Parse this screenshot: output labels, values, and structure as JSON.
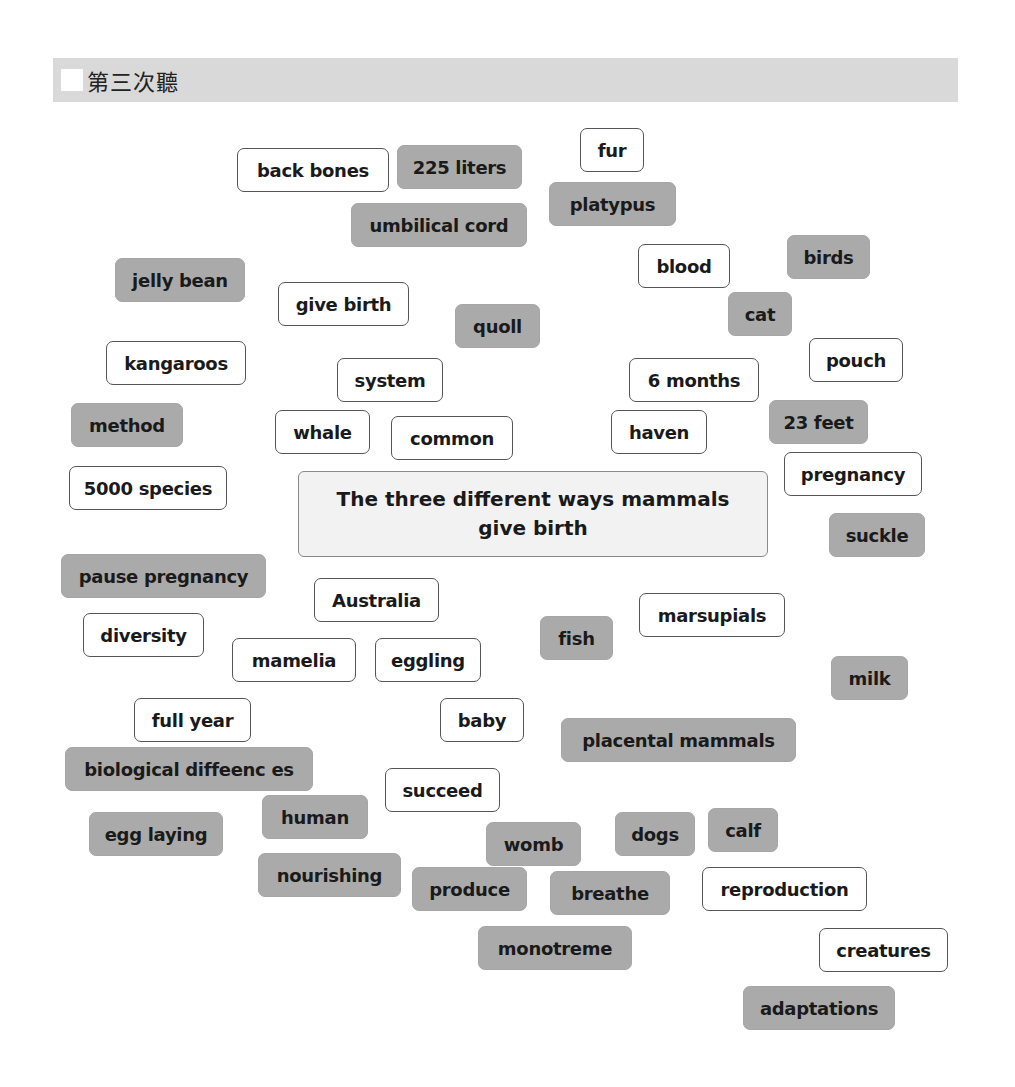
{
  "header": {
    "title": "第三次聽"
  },
  "center": {
    "title": "The three different  ways mammals give birth"
  },
  "colors": {
    "header_band": "#d9d9d9",
    "grey_card": "#aaaaaa",
    "white_card": "#ffffff",
    "center_box": "#f2f2f2",
    "text": "#1a1a1a"
  },
  "cards": [
    {
      "label": "back bones",
      "style": "white",
      "x": 237,
      "y": 148,
      "w": 152
    },
    {
      "label": "225 liters",
      "style": "grey",
      "x": 397,
      "y": 145,
      "w": 125
    },
    {
      "label": "fur",
      "style": "white",
      "x": 580,
      "y": 128,
      "w": 64
    },
    {
      "label": "platypus",
      "style": "grey",
      "x": 549,
      "y": 182,
      "w": 127
    },
    {
      "label": "umbilical cord",
      "style": "grey",
      "x": 351,
      "y": 203,
      "w": 176
    },
    {
      "label": "blood",
      "style": "white",
      "x": 638,
      "y": 244,
      "w": 92
    },
    {
      "label": "birds",
      "style": "grey",
      "x": 787,
      "y": 235,
      "w": 83
    },
    {
      "label": "jelly bean",
      "style": "grey",
      "x": 115,
      "y": 258,
      "w": 130
    },
    {
      "label": "give birth",
      "style": "white",
      "x": 278,
      "y": 282,
      "w": 131
    },
    {
      "label": "quoll",
      "style": "grey",
      "x": 455,
      "y": 304,
      "w": 85
    },
    {
      "label": "cat",
      "style": "grey",
      "x": 728,
      "y": 292,
      "w": 64
    },
    {
      "label": "kangaroos",
      "style": "white",
      "x": 106,
      "y": 341,
      "w": 140
    },
    {
      "label": "system",
      "style": "white",
      "x": 337,
      "y": 358,
      "w": 106
    },
    {
      "label": "pouch",
      "style": "white",
      "x": 809,
      "y": 338,
      "w": 94
    },
    {
      "label": "6 months",
      "style": "white",
      "x": 629,
      "y": 358,
      "w": 130
    },
    {
      "label": "method",
      "style": "grey",
      "x": 71,
      "y": 403,
      "w": 112
    },
    {
      "label": "whale",
      "style": "white",
      "x": 275,
      "y": 410,
      "w": 95
    },
    {
      "label": "common",
      "style": "white",
      "x": 391,
      "y": 416,
      "w": 122
    },
    {
      "label": "haven",
      "style": "white",
      "x": 611,
      "y": 410,
      "w": 96
    },
    {
      "label": "23 feet",
      "style": "grey",
      "x": 769,
      "y": 400,
      "w": 99
    },
    {
      "label": "5000 species",
      "style": "white",
      "x": 69,
      "y": 466,
      "w": 158
    },
    {
      "label": "pregnancy",
      "style": "white",
      "x": 784,
      "y": 452,
      "w": 138
    },
    {
      "label": "suckle",
      "style": "grey",
      "x": 829,
      "y": 513,
      "w": 96
    },
    {
      "label": "pause pregnancy",
      "style": "grey",
      "x": 61,
      "y": 554,
      "w": 205
    },
    {
      "label": "Australia",
      "style": "white",
      "x": 314,
      "y": 578,
      "w": 125
    },
    {
      "label": "diversity",
      "style": "white",
      "x": 83,
      "y": 613,
      "w": 121
    },
    {
      "label": "marsupials",
      "style": "white",
      "x": 639,
      "y": 593,
      "w": 146
    },
    {
      "label": "fish",
      "style": "grey",
      "x": 540,
      "y": 616,
      "w": 73
    },
    {
      "label": "mamelia",
      "style": "white",
      "x": 232,
      "y": 638,
      "w": 124
    },
    {
      "label": "eggling",
      "style": "white",
      "x": 375,
      "y": 638,
      "w": 106
    },
    {
      "label": "milk",
      "style": "grey",
      "x": 831,
      "y": 656,
      "w": 77
    },
    {
      "label": "full year",
      "style": "white",
      "x": 134,
      "y": 698,
      "w": 117
    },
    {
      "label": "baby",
      "style": "white",
      "x": 440,
      "y": 698,
      "w": 84
    },
    {
      "label": "placental mammals",
      "style": "grey",
      "x": 561,
      "y": 718,
      "w": 235
    },
    {
      "label": "biological diffeenc es",
      "style": "grey",
      "x": 65,
      "y": 747,
      "w": 248
    },
    {
      "label": "succeed",
      "style": "white",
      "x": 385,
      "y": 768,
      "w": 115
    },
    {
      "label": "human",
      "style": "grey",
      "x": 262,
      "y": 795,
      "w": 106
    },
    {
      "label": "egg laying",
      "style": "grey",
      "x": 89,
      "y": 812,
      "w": 134
    },
    {
      "label": "womb",
      "style": "grey",
      "x": 486,
      "y": 822,
      "w": 95
    },
    {
      "label": "dogs",
      "style": "grey",
      "x": 615,
      "y": 812,
      "w": 80
    },
    {
      "label": "calf",
      "style": "grey",
      "x": 708,
      "y": 808,
      "w": 70
    },
    {
      "label": "nourishing",
      "style": "grey",
      "x": 258,
      "y": 853,
      "w": 143
    },
    {
      "label": "produce",
      "style": "grey",
      "x": 412,
      "y": 867,
      "w": 115
    },
    {
      "label": "breathe",
      "style": "grey",
      "x": 550,
      "y": 871,
      "w": 120
    },
    {
      "label": "reproduction",
      "style": "white",
      "x": 702,
      "y": 867,
      "w": 165
    },
    {
      "label": "monotreme",
      "style": "grey",
      "x": 478,
      "y": 926,
      "w": 154
    },
    {
      "label": "creatures",
      "style": "white",
      "x": 819,
      "y": 928,
      "w": 129
    },
    {
      "label": "adaptations",
      "style": "grey",
      "x": 743,
      "y": 986,
      "w": 152
    }
  ]
}
